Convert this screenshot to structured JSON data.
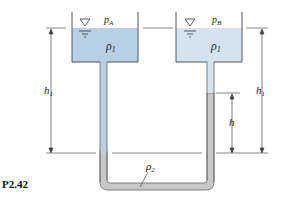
{
  "figure": {
    "caption": "P2.42",
    "left_tank": {
      "pressure_label": "p",
      "pressure_sub": "A",
      "fluid_label": "ρ",
      "fluid_sub": "1"
    },
    "right_tank": {
      "pressure_label": "p",
      "pressure_sub": "B",
      "fluid_label": "ρ",
      "fluid_sub": "1"
    },
    "manometer_fluid": {
      "label": "ρ",
      "sub": "2"
    },
    "dimensions": {
      "left_h1": {
        "label": "h",
        "sub": "1"
      },
      "right_h1": {
        "label": "h",
        "sub": "1"
      },
      "h": {
        "label": "h"
      }
    },
    "colors": {
      "fluid1": "#b8d0e6",
      "fluid2": "#c8c8c8",
      "line": "#444444"
    }
  }
}
